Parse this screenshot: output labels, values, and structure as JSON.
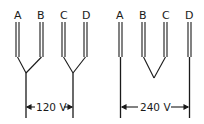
{
  "left_config": {
    "terminal_labels": [
      "A",
      "B",
      "C",
      "D"
    ],
    "voltage_label": "120 V",
    "description": "A-B joined, C-D joined (parallel)"
  },
  "right_config": {
    "terminal_labels": [
      "A",
      "B",
      "C",
      "D"
    ],
    "voltage_label": "240 V",
    "description": "B-C joined (series), A and D as leads"
  },
  "colors": {
    "line": "#1a1a1a",
    "background": "#ffffff"
  }
}
